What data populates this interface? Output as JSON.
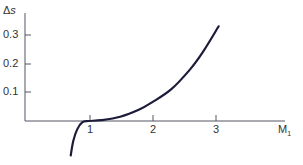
{
  "chart_data": {
    "type": "line",
    "title": "",
    "xlabel": "M1",
    "ylabel": "Δs",
    "xlim": [
      0,
      4.2
    ],
    "ylim": [
      -0.12,
      0.38
    ],
    "x_ticks": [
      "1",
      "2",
      "3"
    ],
    "y_ticks": [
      "0.1",
      "0.2",
      "0.3"
    ],
    "grid": false,
    "series": [
      {
        "name": "Δs vs M1",
        "x": [
          0.72,
          0.76,
          0.82,
          0.9,
          1.0,
          1.2,
          1.5,
          1.8,
          2.0,
          2.3,
          2.6,
          2.8,
          3.05
        ],
        "y": [
          -0.12,
          -0.07,
          -0.03,
          -0.005,
          0.0,
          0.003,
          0.015,
          0.04,
          0.065,
          0.11,
          0.18,
          0.24,
          0.33
        ]
      }
    ]
  },
  "labels": {
    "ylabel_delta": "Δ",
    "ylabel_s": "s",
    "xlabel_m": "M",
    "xlabel_sub": "1",
    "xticks": [
      "1",
      "2",
      "3"
    ],
    "yticks": [
      "0.1",
      "0.2",
      "0.3"
    ]
  }
}
